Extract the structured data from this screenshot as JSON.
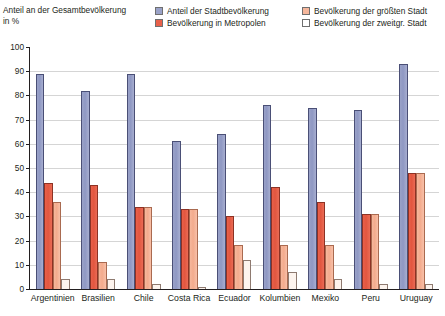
{
  "axis_title": "Anteil an der Gesamtbevölkerung\nin %",
  "legend": {
    "items": [
      {
        "label": "Anteil der Stadtbevölkerung",
        "key": "urban",
        "swatch_name": "legend-swatch-urban",
        "color": "#9aa2c8"
      },
      {
        "label": "Bevölkerung der größten Stadt",
        "key": "largest",
        "swatch_name": "legend-swatch-largest",
        "color": "#f6b79c"
      },
      {
        "label": "Bevölkerung in Metropolen",
        "key": "metro",
        "swatch_name": "legend-swatch-metro",
        "color": "#e8604a"
      },
      {
        "label": "Bevölkerung der zweitgr. Stadt",
        "key": "second",
        "swatch_name": "legend-swatch-second",
        "color": "#ffffff"
      }
    ]
  },
  "yaxis": {
    "ticks": [
      "100",
      "90",
      "80",
      "70",
      "60",
      "50",
      "40",
      "30",
      "20",
      "10",
      "0"
    ],
    "min": 0,
    "max": 100,
    "step": 10
  },
  "chart_data": {
    "type": "bar",
    "title": "",
    "subtitle": "",
    "xlabel": "",
    "ylabel": "Anteil an der Gesamtbevölkerung in %",
    "ylim": [
      0,
      100
    ],
    "ytick_values": [
      0,
      10,
      20,
      30,
      40,
      50,
      60,
      70,
      80,
      90,
      100
    ],
    "grid": "horizontal",
    "legend_position": "top",
    "categories": [
      "Argentinien",
      "Brasilien",
      "Chile",
      "Costa Rica",
      "Ecuador",
      "Kolumbien",
      "Mexiko",
      "Peru",
      "Uruguay"
    ],
    "series": [
      {
        "name": "Anteil der Stadtbevölkerung",
        "color": "#9aa2c8",
        "values": [
          89,
          82,
          89,
          61,
          64,
          76,
          75,
          74,
          93
        ]
      },
      {
        "name": "Bevölkerung in Metropolen",
        "color": "#e8604a",
        "values": [
          44,
          43,
          34,
          33,
          30,
          42,
          36,
          31,
          48
        ]
      },
      {
        "name": "Bevölkerung der größten Stadt",
        "color": "#f6b79c",
        "values": [
          36,
          11,
          34,
          33,
          18,
          18,
          18,
          31,
          48
        ]
      },
      {
        "name": "Bevölkerung der zweitgr. Stadt",
        "color": "#ffffff",
        "values": [
          4,
          4,
          2,
          1,
          12,
          7,
          4,
          2,
          2
        ]
      }
    ]
  }
}
